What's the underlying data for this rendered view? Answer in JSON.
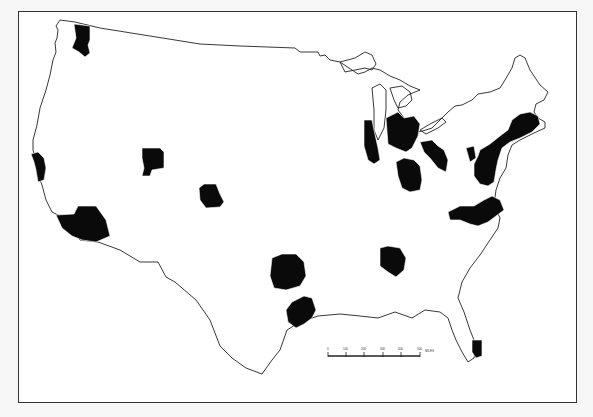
{
  "map": {
    "title": "",
    "region": "Conterminous United States",
    "feature_type": "Metropolitan areas (county-based, shaded black)",
    "metro_areas": [
      {
        "name": "Seattle",
        "shape": "seattle"
      },
      {
        "name": "San Francisco Bay Area",
        "shape": "sf"
      },
      {
        "name": "Los Angeles",
        "shape": "la"
      },
      {
        "name": "Salt Lake City",
        "shape": "slc"
      },
      {
        "name": "Denver",
        "shape": "denver"
      },
      {
        "name": "Dallas-Fort Worth",
        "shape": "dallas"
      },
      {
        "name": "Houston",
        "shape": "houston"
      },
      {
        "name": "Atlanta",
        "shape": "atlanta"
      },
      {
        "name": "Chicago",
        "shape": "chicago"
      },
      {
        "name": "Detroit",
        "shape": "detroit"
      },
      {
        "name": "Cincinnati-Indianapolis",
        "shape": "cincy"
      },
      {
        "name": "Pittsburgh-Cleveland",
        "shape": "pitt"
      },
      {
        "name": "Northeast corridor",
        "shape": "northeast"
      },
      {
        "name": "North Carolina Piedmont",
        "shape": "nc"
      },
      {
        "name": "Miami",
        "shape": "miami"
      }
    ],
    "colors": {
      "metro_fill": "#0a0a0a",
      "outline": "#222222",
      "background": "#ffffff"
    }
  },
  "scale_bar": {
    "ticks": [
      "0",
      "100",
      "200",
      "300",
      "400",
      "500"
    ],
    "unit": "MILES"
  }
}
